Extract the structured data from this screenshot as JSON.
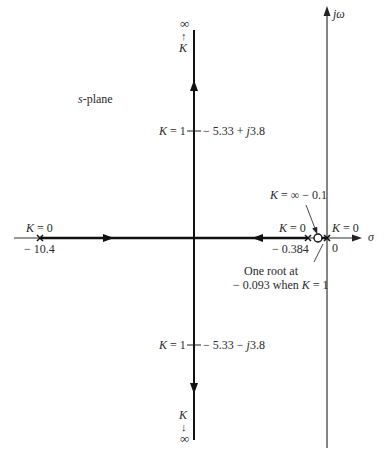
{
  "diagram": {
    "type": "root-locus",
    "plane_label": "s-plane",
    "axes": {
      "real_axis_label": "σ",
      "imag_axis_label": "jω",
      "origin_label": "0"
    },
    "top_asymptote": {
      "infinity": "∞",
      "arrow": "↑",
      "k": "K"
    },
    "bottom_asymptote": {
      "infinity": "∞",
      "arrow": "↓",
      "k": "K"
    },
    "poles": [
      {
        "value": "− 10.4",
        "k_label": "K = 0"
      },
      {
        "value": "− 0.384",
        "k_label": "K = 0"
      },
      {
        "value": "0",
        "k_label": "K = 0"
      }
    ],
    "zero": {
      "value": "− 0.1",
      "k_label": "K = ∞"
    },
    "k1_upper": {
      "k_label": "K = 1",
      "value": "− 5.33 + j3.8"
    },
    "k1_lower": {
      "k_label": "K = 1",
      "value": "− 5.33 − j3.8"
    },
    "annotation": {
      "line1": "One root at",
      "line2": "− 0.093 when K = 1"
    }
  }
}
